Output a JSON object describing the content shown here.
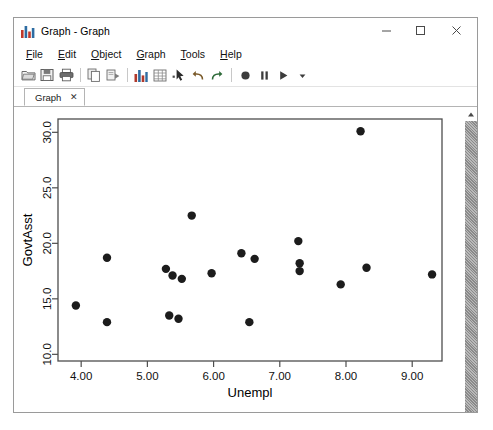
{
  "window": {
    "title": "Graph - Graph",
    "app_icon": "bar-chart-icon",
    "controls": {
      "minimize": "–",
      "maximize": "□",
      "close": "✕"
    }
  },
  "menu": {
    "items": [
      {
        "label": "File",
        "mnemonic": "F",
        "rest": "ile"
      },
      {
        "label": "Edit",
        "mnemonic": "E",
        "rest": "dit"
      },
      {
        "label": "Object",
        "mnemonic": "O",
        "rest": "bject"
      },
      {
        "label": "Graph",
        "mnemonic": "G",
        "rest": "raph"
      },
      {
        "label": "Tools",
        "mnemonic": "T",
        "rest": "ools"
      },
      {
        "label": "Help",
        "mnemonic": "H",
        "rest": "elp"
      }
    ]
  },
  "toolbar": {
    "buttons": [
      "open-folder-icon",
      "save-disk-icon",
      "print-icon",
      "copy-icon",
      "paste-icon",
      "graph-chart-icon",
      "data-sheet-icon",
      "pointer-select-icon",
      "undo-icon",
      "redo-icon",
      "record-icon",
      "pause-icon",
      "run-play-icon",
      "dropdown-arrow-icon"
    ]
  },
  "tabs": [
    {
      "label": "Graph",
      "close": "✕",
      "active": true
    }
  ],
  "scrollbar": {
    "up_arrow": "scroll-up-arrow-icon"
  },
  "chart_data": {
    "type": "scatter",
    "title": "",
    "xlabel": "Unempl",
    "ylabel": "GovtAsst",
    "xlim": [
      3.65,
      9.45
    ],
    "ylim": [
      9.4,
      31.2
    ],
    "xticks": [
      "4.00",
      "5.00",
      "6.00",
      "7.00",
      "8.00",
      "9.00"
    ],
    "xtickvals": [
      4.0,
      5.0,
      6.0,
      7.0,
      8.0,
      9.0
    ],
    "yticks": [
      "10.0",
      "15.0",
      "20.0",
      "25.0",
      "30.0"
    ],
    "ytickvals": [
      10.0,
      15.0,
      20.0,
      25.0,
      30.0
    ],
    "grid": false,
    "legend": false,
    "marker": {
      "shape": "circle",
      "size": 4.2,
      "color": "#1c1c1c"
    },
    "frame_color": "#4d4d4d",
    "points": [
      {
        "x": 3.92,
        "y": 14.4
      },
      {
        "x": 4.39,
        "y": 18.7
      },
      {
        "x": 4.39,
        "y": 12.9
      },
      {
        "x": 5.28,
        "y": 17.7
      },
      {
        "x": 5.38,
        "y": 17.1
      },
      {
        "x": 5.33,
        "y": 13.5
      },
      {
        "x": 5.47,
        "y": 13.2
      },
      {
        "x": 5.52,
        "y": 16.8
      },
      {
        "x": 5.67,
        "y": 22.5
      },
      {
        "x": 5.97,
        "y": 17.3
      },
      {
        "x": 6.42,
        "y": 19.1
      },
      {
        "x": 6.54,
        "y": 12.9
      },
      {
        "x": 6.62,
        "y": 18.6
      },
      {
        "x": 7.28,
        "y": 20.2
      },
      {
        "x": 7.3,
        "y": 18.2
      },
      {
        "x": 7.3,
        "y": 17.5
      },
      {
        "x": 7.92,
        "y": 16.3
      },
      {
        "x": 8.22,
        "y": 30.1
      },
      {
        "x": 8.31,
        "y": 17.8
      },
      {
        "x": 9.3,
        "y": 17.2
      }
    ]
  }
}
